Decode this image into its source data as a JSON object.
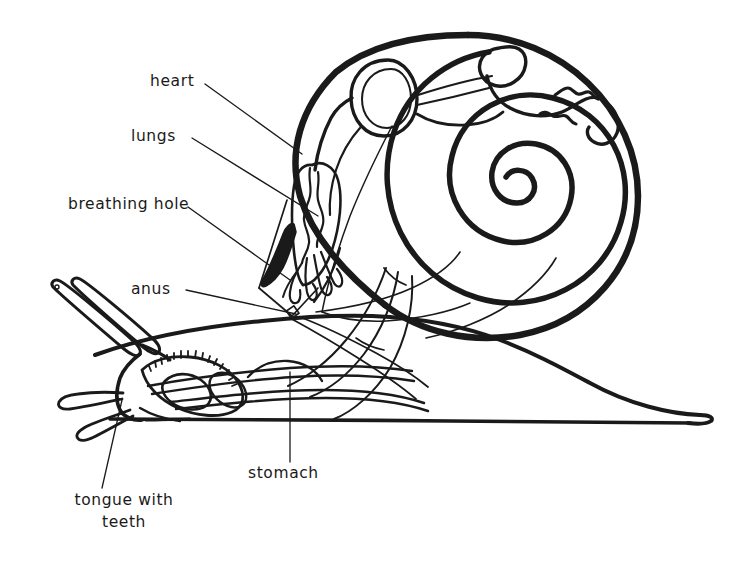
{
  "diagram": {
    "style": "black line drawing on white",
    "ink_color": "#1a1a1a",
    "background_color": "#ffffff",
    "labels": [
      {
        "id": "heart",
        "text": "heart",
        "x": 150,
        "y": 78,
        "align": "left",
        "lines": 1
      },
      {
        "id": "lungs",
        "text": "lungs",
        "x": 131,
        "y": 132,
        "align": "left",
        "lines": 1
      },
      {
        "id": "breathing-hole",
        "text": "breathing hole",
        "x": 68,
        "y": 200,
        "align": "left",
        "lines": 1
      },
      {
        "id": "anus",
        "text": "anus",
        "x": 131,
        "y": 284,
        "align": "left",
        "lines": 1
      },
      {
        "id": "stomach",
        "text": "stomach",
        "x": 248,
        "y": 469,
        "align": "left",
        "lines": 1
      },
      {
        "id": "tongue-with-teeth",
        "text": "tongue with\nteeth",
        "x": 64,
        "y": 496,
        "align": "center",
        "lines": 2
      }
    ],
    "parts": [
      "shell",
      "spiral",
      "heart",
      "lungs",
      "breathing hole",
      "anus",
      "stomach",
      "tongue with teeth",
      "tentacles",
      "foot"
    ]
  }
}
